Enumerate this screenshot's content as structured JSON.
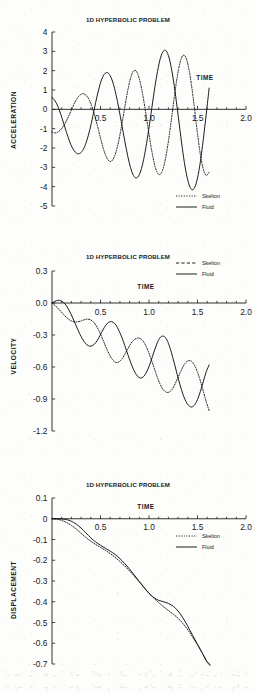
{
  "document": {
    "series_names": {
      "skeleton": "Skelton",
      "fluid": "Fluid"
    },
    "shared_title": "1D HYPERBOLIC PROBLEM",
    "time_axis_label": "TIME"
  },
  "chart_data": [
    {
      "id": "acceleration",
      "type": "line",
      "title": "1D HYPERBOLIC PROBLEM",
      "xlabel": "TIME",
      "ylabel": "ACCELERATION",
      "xlim": [
        0,
        2.0
      ],
      "ylim": [
        -5,
        4
      ],
      "xticks": [
        0.5,
        1.0,
        1.5,
        2.0
      ],
      "xticklabels": [
        "0.5",
        "1.0",
        "1.5",
        "2.0"
      ],
      "yticks": [
        4,
        3,
        2,
        1,
        0,
        -1,
        -2,
        -3,
        -4,
        -5
      ],
      "yticklabels": [
        "4",
        "3",
        "2",
        "1",
        "0",
        "-1",
        "-2",
        "-3",
        "-4",
        "-5"
      ],
      "grid": false,
      "legend_position": "bottom-right",
      "legend_style": {
        "skeleton": "dotted",
        "fluid": "solid"
      },
      "series": [
        {
          "name": "Fluid",
          "style": "solid",
          "x": [
            0.0,
            0.03,
            0.06,
            0.09,
            0.12,
            0.15,
            0.18,
            0.21,
            0.24,
            0.27,
            0.3,
            0.33,
            0.36,
            0.39,
            0.42,
            0.45,
            0.48,
            0.51,
            0.54,
            0.57,
            0.6,
            0.63,
            0.66,
            0.69,
            0.72,
            0.75,
            0.78,
            0.81,
            0.84,
            0.87,
            0.9,
            0.93,
            0.96,
            0.99,
            1.02,
            1.05,
            1.08,
            1.11,
            1.14,
            1.17,
            1.2,
            1.23,
            1.26,
            1.29,
            1.32,
            1.35,
            1.38,
            1.41,
            1.44,
            1.47,
            1.5,
            1.53,
            1.56,
            1.59,
            1.62
          ],
          "y": [
            0.62,
            0.45,
            0.16,
            -0.25,
            -0.72,
            -1.2,
            -1.64,
            -1.99,
            -2.21,
            -2.3,
            -2.23,
            -2.0,
            -1.6,
            -1.05,
            -0.38,
            0.35,
            1.0,
            1.52,
            1.82,
            1.9,
            1.74,
            1.35,
            0.76,
            0.02,
            -0.8,
            -1.63,
            -2.4,
            -3.02,
            -3.42,
            -3.55,
            -3.38,
            -2.92,
            -2.2,
            -1.28,
            -0.25,
            0.8,
            1.75,
            2.5,
            2.95,
            3.05,
            2.78,
            2.15,
            1.22,
            0.1,
            -1.1,
            -2.25,
            -3.2,
            -3.85,
            -4.15,
            -4.05,
            -3.55,
            -2.7,
            -1.55,
            -0.25,
            1.1
          ]
        },
        {
          "name": "Skelton",
          "style": "dotted",
          "x": [
            0.0,
            0.03,
            0.06,
            0.09,
            0.12,
            0.15,
            0.18,
            0.21,
            0.24,
            0.27,
            0.3,
            0.33,
            0.36,
            0.39,
            0.42,
            0.45,
            0.48,
            0.51,
            0.54,
            0.57,
            0.6,
            0.63,
            0.66,
            0.69,
            0.72,
            0.75,
            0.78,
            0.81,
            0.84,
            0.87,
            0.9,
            0.93,
            0.96,
            0.99,
            1.02,
            1.05,
            1.08,
            1.11,
            1.14,
            1.17,
            1.2,
            1.23,
            1.26,
            1.29,
            1.32,
            1.35,
            1.38,
            1.41,
            1.44,
            1.47,
            1.5,
            1.53,
            1.56,
            1.59,
            1.62
          ],
          "y": [
            -1.18,
            -1.22,
            -1.18,
            -1.05,
            -0.85,
            -0.58,
            -0.26,
            0.08,
            0.4,
            0.64,
            0.78,
            0.8,
            0.68,
            0.42,
            0.02,
            -0.5,
            -1.08,
            -1.68,
            -2.2,
            -2.56,
            -2.7,
            -2.58,
            -2.2,
            -1.58,
            -0.78,
            0.1,
            0.95,
            1.62,
            1.98,
            1.96,
            1.58,
            0.9,
            0.02,
            -0.95,
            -1.9,
            -2.7,
            -3.22,
            -3.38,
            -3.15,
            -2.55,
            -1.65,
            -0.55,
            0.6,
            1.65,
            2.42,
            2.78,
            2.68,
            2.12,
            1.18,
            0.0,
            -1.25,
            -2.35,
            -3.1,
            -3.42,
            -3.25
          ]
        }
      ]
    },
    {
      "id": "velocity",
      "type": "line",
      "title": "1D HYPERBOLIC PROBLEM",
      "xlabel": "TIME",
      "ylabel": "VELOCITY",
      "xlim": [
        0,
        2.0
      ],
      "ylim": [
        -1.2,
        0.3
      ],
      "xticks": [
        0.5,
        1.0,
        1.5,
        2.0
      ],
      "xticklabels": [
        "0.5",
        "1.0",
        "1.5",
        "2.0"
      ],
      "yticks": [
        0.3,
        0.0,
        -0.3,
        -0.6,
        -0.9,
        -1.2
      ],
      "yticklabels": [
        "0.3",
        "0.0",
        "-0.3",
        "-0.6",
        "-0.9",
        "-1.2"
      ],
      "grid": false,
      "legend_position": "top-right",
      "legend_style": {
        "skeleton": "dashed",
        "fluid": "solid"
      },
      "series": [
        {
          "name": "Fluid",
          "style": "solid",
          "x": [
            0.0,
            0.03,
            0.06,
            0.09,
            0.12,
            0.15,
            0.18,
            0.21,
            0.24,
            0.27,
            0.3,
            0.33,
            0.36,
            0.39,
            0.42,
            0.45,
            0.48,
            0.51,
            0.54,
            0.57,
            0.6,
            0.63,
            0.66,
            0.69,
            0.72,
            0.75,
            0.78,
            0.81,
            0.84,
            0.87,
            0.9,
            0.93,
            0.96,
            0.99,
            1.02,
            1.05,
            1.08,
            1.11,
            1.14,
            1.17,
            1.2,
            1.23,
            1.26,
            1.29,
            1.32,
            1.35,
            1.38,
            1.41,
            1.44,
            1.47,
            1.5,
            1.53,
            1.56,
            1.59,
            1.62
          ],
          "y": [
            0.0,
            0.015,
            0.025,
            0.022,
            0.005,
            -0.028,
            -0.075,
            -0.132,
            -0.195,
            -0.258,
            -0.315,
            -0.36,
            -0.392,
            -0.405,
            -0.398,
            -0.372,
            -0.33,
            -0.278,
            -0.228,
            -0.192,
            -0.175,
            -0.18,
            -0.208,
            -0.258,
            -0.322,
            -0.398,
            -0.478,
            -0.555,
            -0.622,
            -0.672,
            -0.7,
            -0.7,
            -0.672,
            -0.618,
            -0.545,
            -0.462,
            -0.385,
            -0.33,
            -0.31,
            -0.325,
            -0.378,
            -0.462,
            -0.562,
            -0.668,
            -0.768,
            -0.855,
            -0.922,
            -0.962,
            -0.975,
            -0.955,
            -0.905,
            -0.828,
            -0.735,
            -0.645,
            -0.58
          ]
        },
        {
          "name": "Skelton",
          "style": "dotted",
          "x": [
            0.0,
            0.03,
            0.06,
            0.09,
            0.12,
            0.15,
            0.18,
            0.21,
            0.24,
            0.27,
            0.3,
            0.33,
            0.36,
            0.39,
            0.42,
            0.45,
            0.48,
            0.51,
            0.54,
            0.57,
            0.6,
            0.63,
            0.66,
            0.69,
            0.72,
            0.75,
            0.78,
            0.81,
            0.84,
            0.87,
            0.9,
            0.93,
            0.96,
            0.99,
            1.02,
            1.05,
            1.08,
            1.11,
            1.14,
            1.17,
            1.2,
            1.23,
            1.26,
            1.29,
            1.32,
            1.35,
            1.38,
            1.41,
            1.44,
            1.47,
            1.5,
            1.53,
            1.56,
            1.59,
            1.62
          ],
          "y": [
            0.0,
            -0.022,
            -0.048,
            -0.078,
            -0.108,
            -0.135,
            -0.158,
            -0.172,
            -0.178,
            -0.175,
            -0.168,
            -0.158,
            -0.152,
            -0.155,
            -0.172,
            -0.205,
            -0.252,
            -0.312,
            -0.378,
            -0.442,
            -0.498,
            -0.538,
            -0.558,
            -0.552,
            -0.525,
            -0.482,
            -0.432,
            -0.385,
            -0.35,
            -0.332,
            -0.33,
            -0.348,
            -0.388,
            -0.448,
            -0.522,
            -0.602,
            -0.682,
            -0.752,
            -0.805,
            -0.832,
            -0.838,
            -0.818,
            -0.775,
            -0.718,
            -0.655,
            -0.598,
            -0.558,
            -0.54,
            -0.548,
            -0.585,
            -0.648,
            -0.732,
            -0.828,
            -0.925,
            -1.01
          ]
        }
      ]
    },
    {
      "id": "displacement",
      "type": "line",
      "title": "1D HYPERBOLIC PROBLEM",
      "xlabel": "TIME",
      "ylabel": "DISPLACEMENT",
      "xlim": [
        0,
        2.0
      ],
      "ylim": [
        -0.7,
        0.1
      ],
      "xticks": [
        0.5,
        1.0,
        1.5,
        2.0
      ],
      "xticklabels": [
        "0.5",
        "1.0",
        "1.5",
        "2.0"
      ],
      "yticks": [
        0.1,
        0,
        -0.1,
        -0.2,
        -0.3,
        -0.4,
        -0.5,
        -0.6,
        -0.7
      ],
      "yticklabels": [
        "0.1",
        "0",
        "-0.1",
        "-0.2",
        "-0.3",
        "-0.4",
        "-0.5",
        "-0.6",
        "-0.7"
      ],
      "grid": false,
      "legend_position": "middle-right",
      "legend_style": {
        "skeleton": "dotted",
        "fluid": "solid"
      },
      "series": [
        {
          "name": "Fluid",
          "style": "solid",
          "x": [
            0.0,
            0.05,
            0.1,
            0.15,
            0.2,
            0.25,
            0.3,
            0.35,
            0.4,
            0.45,
            0.5,
            0.55,
            0.6,
            0.65,
            0.7,
            0.75,
            0.8,
            0.85,
            0.9,
            0.95,
            1.0,
            1.05,
            1.1,
            1.15,
            1.2,
            1.25,
            1.3,
            1.35,
            1.4,
            1.45,
            1.5,
            1.55,
            1.6,
            1.63
          ],
          "y": [
            0.0,
            0.0,
            -0.001,
            -0.004,
            -0.012,
            -0.026,
            -0.045,
            -0.068,
            -0.092,
            -0.112,
            -0.128,
            -0.142,
            -0.156,
            -0.172,
            -0.192,
            -0.216,
            -0.243,
            -0.272,
            -0.302,
            -0.332,
            -0.36,
            -0.38,
            -0.393,
            -0.4,
            -0.408,
            -0.422,
            -0.445,
            -0.478,
            -0.518,
            -0.562,
            -0.605,
            -0.648,
            -0.692,
            -0.706
          ]
        },
        {
          "name": "Skelton",
          "style": "dotted",
          "x": [
            0.0,
            0.05,
            0.1,
            0.15,
            0.2,
            0.25,
            0.3,
            0.35,
            0.4,
            0.45,
            0.5,
            0.55,
            0.6,
            0.65,
            0.7,
            0.75,
            0.8,
            0.85,
            0.9,
            0.95,
            1.0,
            1.05,
            1.1,
            1.15,
            1.2,
            1.25,
            1.3,
            1.35,
            1.4,
            1.45,
            1.5,
            1.55,
            1.6,
            1.63
          ],
          "y": [
            0.0,
            -0.002,
            -0.008,
            -0.018,
            -0.032,
            -0.05,
            -0.07,
            -0.09,
            -0.108,
            -0.124,
            -0.138,
            -0.152,
            -0.168,
            -0.186,
            -0.206,
            -0.228,
            -0.252,
            -0.278,
            -0.305,
            -0.332,
            -0.358,
            -0.382,
            -0.404,
            -0.424,
            -0.442,
            -0.46,
            -0.48,
            -0.505,
            -0.535,
            -0.57,
            -0.608,
            -0.648,
            -0.688,
            -0.702
          ]
        }
      ]
    }
  ]
}
